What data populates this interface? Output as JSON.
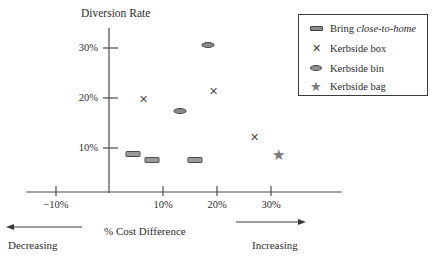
{
  "chart_data": {
    "type": "scatter",
    "title": "",
    "xlabel": "% Cost Difference",
    "ylabel": "Diversion Rate",
    "xlim": [
      -13,
      40
    ],
    "ylim": [
      0,
      34
    ],
    "grid": false,
    "legend_position": "top-right",
    "xticks": [
      "-10%",
      "10%",
      "20%",
      "30%"
    ],
    "xtick_values": [
      -10,
      10,
      20,
      30
    ],
    "yticks": [
      "10%",
      "20%",
      "30%"
    ],
    "ytick_values": [
      10,
      20,
      30
    ],
    "x_axis_annotations": {
      "left_label": "Decreasing",
      "right_label": "Increasing"
    },
    "series": [
      {
        "name": "Bring close-to-home",
        "marker": "rect",
        "color": "#9a9a9a",
        "points": [
          {
            "x": 4.4,
            "y": 8.8
          },
          {
            "x": 8.0,
            "y": 7.7
          },
          {
            "x": 16.0,
            "y": 7.7
          }
        ]
      },
      {
        "name": "Kerbside box",
        "marker": "cross",
        "color": "#4a4a4a",
        "points": [
          {
            "x": 6.3,
            "y": 19.8
          },
          {
            "x": 19.4,
            "y": 21.5
          },
          {
            "x": 27.0,
            "y": 12.2
          }
        ]
      },
      {
        "name": "Kerbside bin",
        "marker": "ellipse",
        "color": "#8b8b8b",
        "points": [
          {
            "x": 13.1,
            "y": 17.4
          },
          {
            "x": 18.3,
            "y": 30.7
          }
        ]
      },
      {
        "name": "Kerbside bag",
        "marker": "star",
        "color": "#7a7a7a",
        "points": [
          {
            "x": 31.4,
            "y": 8.6
          }
        ]
      }
    ]
  },
  "legend": {
    "items": [
      {
        "marker": "rect",
        "label_plain": "Bring ",
        "label_italic": "close-to-home"
      },
      {
        "marker": "cross",
        "label_plain": "Kerbside box",
        "label_italic": ""
      },
      {
        "marker": "ellipse",
        "label_plain": "Kerbside bin",
        "label_italic": ""
      },
      {
        "marker": "star",
        "label_plain": "Kerbside bag",
        "label_italic": ""
      }
    ]
  },
  "axis_labels": {
    "y_title": "Diversion Rate",
    "x_title": "% Cost Difference",
    "y_tick_0": "30%",
    "y_tick_1": "20%",
    "y_tick_2": "10%",
    "x_tick_0": "−10%",
    "x_tick_1": "10%",
    "x_tick_2": "20%",
    "x_tick_3": "30%",
    "decreasing": "Decreasing",
    "increasing": "Increasing"
  },
  "glyphs": {
    "cross": "✕",
    "star": "★"
  }
}
